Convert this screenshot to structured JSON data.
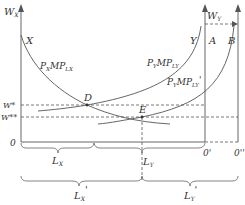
{
  "diagram": {
    "type": "two-sector labor market equilibrium (box diagram)",
    "axes": {
      "left_vertical": "W_X",
      "right_vertical": "W_Y",
      "origin_left": "0",
      "origin_right": "0'",
      "origin_right_shifted": "0''"
    },
    "curves": [
      {
        "id": "X",
        "label_top": "X",
        "label": "P_X MP_LX"
      },
      {
        "id": "Y",
        "label_top": "Y",
        "label": "P_Y MP_LY",
        "anchor": "A"
      },
      {
        "id": "Y_shifted",
        "label": "P_Y MP_LY'",
        "anchor": "B"
      }
    ],
    "points": [
      {
        "name": "D",
        "wage": "W*"
      },
      {
        "name": "E",
        "wage": "W**"
      }
    ],
    "wage_levels": [
      "W*",
      "W**"
    ],
    "braces": [
      {
        "label": "L_X",
        "row": 1
      },
      {
        "label": "L_Y",
        "row": 1
      },
      {
        "label": "L_X'",
        "row": 2
      },
      {
        "label": "L_Y'",
        "row": 2
      }
    ],
    "shift_arrow": "W_Y"
  },
  "labels": {
    "wx_main": "W",
    "wx_sub": "X",
    "wy_main": "W",
    "wy_sub": "Y",
    "x": "X",
    "y": "Y",
    "a": "A",
    "b": "B",
    "d": "D",
    "e": "E",
    "pxmp": "P",
    "pxmp_sub1": "X",
    "pxmp_mid": "MP",
    "pxmp_sub2": "LX",
    "pymp": "P",
    "pymp_sub1": "Y",
    "pymp_mid": "MP",
    "pymp_sub2": "LY",
    "pymp2": "P",
    "pymp2_sub1": "Y",
    "pymp2_mid": "MP",
    "pymp2_sub2": "LY",
    "pymp2_prime": "'",
    "wstar": "W*",
    "wstar2": "W**",
    "zero": "0",
    "zero_prime": "0'",
    "zero_dprime": "0''",
    "lx": "L",
    "lx_sub": "X",
    "ly": "L",
    "ly_sub": "Y",
    "lx2": "L",
    "lx2_sub": "X",
    "lx2_prime": "'",
    "ly2": "L",
    "ly2_sub": "Y",
    "ly2_prime": "'"
  }
}
